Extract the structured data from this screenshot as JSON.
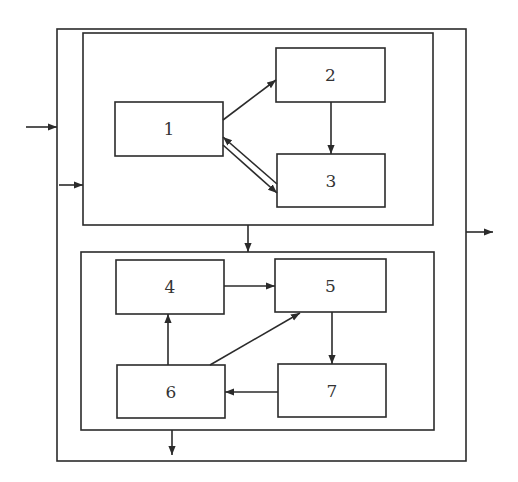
{
  "diagram": {
    "type": "block-diagram",
    "stroke_color": "#2b2b2b",
    "background": "#ffffff",
    "outer_box": {
      "id": "outer",
      "x": 57,
      "y": 29,
      "w": 409,
      "h": 432
    },
    "groups": [
      {
        "id": "top-group",
        "x": 83,
        "y": 33,
        "w": 350,
        "h": 192
      },
      {
        "id": "bottom-group",
        "x": 81,
        "y": 252,
        "w": 353,
        "h": 178
      }
    ],
    "blocks": [
      {
        "id": "1",
        "label": "1",
        "x": 115,
        "y": 102,
        "w": 108,
        "h": 54
      },
      {
        "id": "2",
        "label": "2",
        "x": 276,
        "y": 48,
        "w": 109,
        "h": 54
      },
      {
        "id": "3",
        "label": "3",
        "x": 277,
        "y": 154,
        "w": 108,
        "h": 53
      },
      {
        "id": "4",
        "label": "4",
        "x": 116,
        "y": 260,
        "w": 108,
        "h": 54
      },
      {
        "id": "5",
        "label": "5",
        "x": 275,
        "y": 259,
        "w": 111,
        "h": 53
      },
      {
        "id": "6",
        "label": "6",
        "x": 117,
        "y": 365,
        "w": 108,
        "h": 53
      },
      {
        "id": "7",
        "label": "7",
        "x": 278,
        "y": 364,
        "w": 108,
        "h": 53
      }
    ],
    "edges": [
      {
        "from": "external",
        "to": "outer",
        "x1": 26,
        "y1": 127,
        "x2": 57,
        "y2": 127
      },
      {
        "from": "outer",
        "to": "top-group",
        "x1": 59,
        "y1": 185,
        "x2": 83,
        "y2": 185
      },
      {
        "from": "1",
        "to": "2",
        "x1": 223,
        "y1": 120,
        "x2": 276,
        "y2": 80
      },
      {
        "from": "2",
        "to": "3",
        "x1": 331,
        "y1": 102,
        "x2": 331,
        "y2": 154
      },
      {
        "from": "3",
        "to": "1",
        "x1": 277,
        "y1": 184,
        "x2": 223,
        "y2": 137
      },
      {
        "from": "1",
        "to": "3",
        "x1": 223,
        "y1": 145,
        "x2": 277,
        "y2": 193
      },
      {
        "from": "top-group",
        "to": "bottom-group",
        "x1": 248,
        "y1": 225,
        "x2": 248,
        "y2": 252
      },
      {
        "from": "4",
        "to": "5",
        "x1": 224,
        "y1": 286,
        "x2": 275,
        "y2": 286
      },
      {
        "from": "5",
        "to": "7",
        "x1": 332,
        "y1": 312,
        "x2": 332,
        "y2": 364
      },
      {
        "from": "7",
        "to": "6",
        "x1": 278,
        "y1": 392,
        "x2": 225,
        "y2": 392
      },
      {
        "from": "6",
        "to": "4",
        "x1": 168,
        "y1": 365,
        "x2": 168,
        "y2": 314
      },
      {
        "from": "6",
        "to": "5",
        "x1": 210,
        "y1": 365,
        "x2": 300,
        "y2": 313
      },
      {
        "from": "bottom-group",
        "to": "external",
        "x1": 172,
        "y1": 430,
        "x2": 172,
        "y2": 455
      },
      {
        "from": "outer",
        "to": "external",
        "x1": 466,
        "y1": 232,
        "x2": 493,
        "y2": 232
      }
    ]
  }
}
